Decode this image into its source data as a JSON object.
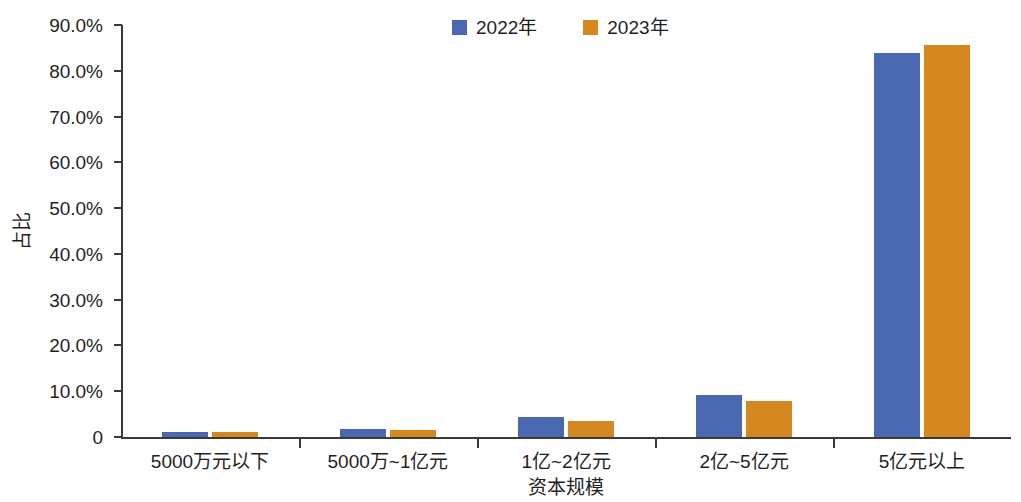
{
  "chart_data": {
    "type": "bar",
    "title": "",
    "subtitle": "",
    "xlabel": "资本规模",
    "ylabel": "占比",
    "categories": [
      "5000万元以下",
      "5000万~1亿元",
      "1亿~2亿元",
      "2亿~5亿元",
      "5亿元以上"
    ],
    "series": [
      {
        "name": "2022年",
        "color": "#4a68af",
        "values": [
          1.2,
          1.8,
          4.4,
          9.2,
          83.8
        ]
      },
      {
        "name": "2023年",
        "color": "#d4881f",
        "values": [
          1.2,
          1.5,
          3.5,
          7.9,
          85.6
        ]
      }
    ],
    "ylim": [
      0,
      90
    ],
    "ytick_values": [
      0,
      10,
      20,
      30,
      40,
      50,
      60,
      70,
      80,
      90
    ],
    "ytick_labels": [
      "0",
      "10.0%",
      "20.0%",
      "30.0%",
      "40.0%",
      "50.0%",
      "60.0%",
      "70.0%",
      "80.0%",
      "90.0%"
    ],
    "grid": false,
    "legend_position": "top-center",
    "legend_entries": [
      "2022年",
      "2023年"
    ],
    "axis_color": "#3a3a3a",
    "background": "#ffffff"
  }
}
